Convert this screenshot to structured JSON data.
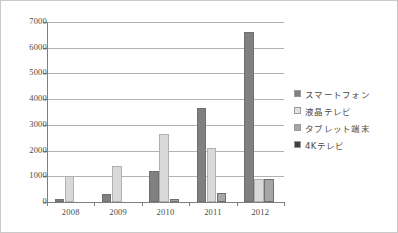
{
  "chart_data": {
    "type": "bar",
    "title": "",
    "subtitle": "",
    "xlabel": "",
    "ylabel": "",
    "categories": [
      "2008",
      "2009",
      "2010",
      "2011",
      "2012"
    ],
    "ylim": [
      0,
      7000
    ],
    "yticks": [
      0,
      1000,
      2000,
      3000,
      4000,
      5000,
      6000,
      7000
    ],
    "ytick_labels": [
      "0",
      "1000",
      "2000",
      "3000",
      "4000",
      "5000",
      "6000",
      "7000"
    ],
    "grid": true,
    "legend_position": "right",
    "series": [
      {
        "name": "スマートフォン",
        "color": "#808080",
        "values": [
          100,
          300,
          1200,
          3650,
          6600
        ]
      },
      {
        "name": "液晶テレビ",
        "color": "#d9d9d9",
        "values": [
          1020,
          1400,
          2650,
          2100,
          900
        ]
      },
      {
        "name": "タブレット端末",
        "color": "#a6a6a6",
        "values": [
          0,
          0,
          100,
          350,
          900
        ]
      },
      {
        "name": "4Kテレビ",
        "color": "#404040",
        "values": [
          0,
          0,
          0,
          0,
          0
        ]
      }
    ]
  },
  "legend": {
    "items": [
      {
        "label": "スマートフォン",
        "swatch": "#808080"
      },
      {
        "label": "液晶テレビ",
        "swatch": "#e2e2e2"
      },
      {
        "label": "タブレット端末",
        "swatch": "#a6a6a6"
      },
      {
        "label": "4Kテレビ",
        "swatch": "#3f3f3f"
      }
    ]
  }
}
